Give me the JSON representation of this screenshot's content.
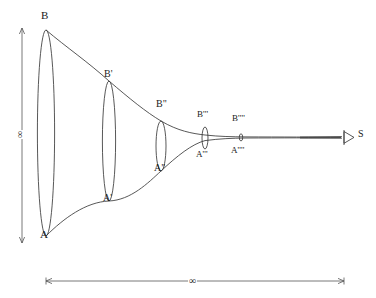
{
  "figure": {
    "type": "geometric-diagram",
    "background_color": "#ffffff",
    "stroke_color": "#3a3a3a",
    "text_color": "#1a1a1a",
    "axes": {
      "vertical": {
        "label": "∞",
        "label_rotated": true,
        "name": "vertical-extent-axis"
      },
      "horizontal": {
        "label": "∞",
        "name": "horizontal-extent-axis"
      }
    },
    "apex": {
      "label": "S",
      "name": "apex-point-s"
    },
    "cross_sections": [
      {
        "id": "section-0",
        "top_label": "B",
        "bottom_label": "A",
        "cx": 46,
        "cy": 133,
        "rx": 8.5,
        "ry": 103
      },
      {
        "id": "section-1",
        "top_label": "B'",
        "bottom_label": "A'",
        "cx": 109,
        "cy": 141,
        "rx": 6.5,
        "ry": 60
      },
      {
        "id": "section-2",
        "top_label": "B\"",
        "bottom_label": "A\"",
        "cx": 161,
        "cy": 143,
        "rx": 5,
        "ry": 28
      },
      {
        "id": "section-3",
        "top_label": "B'''",
        "bottom_label": "A'''",
        "cx": 205,
        "cy": 138,
        "rx": 3,
        "ry": 12
      },
      {
        "id": "section-4",
        "top_label": "B''''",
        "bottom_label": "A''''",
        "cx": 241,
        "cy": 137,
        "rx": 1.6,
        "ry": 4
      }
    ],
    "labels": [
      {
        "id": "lbl-B",
        "text": "B",
        "x": 41,
        "y": 11,
        "size": 11
      },
      {
        "id": "lbl-A",
        "text": "A",
        "x": 40,
        "y": 230,
        "size": 11
      },
      {
        "id": "lbl-Bp",
        "text": "B'",
        "x": 104,
        "y": 70,
        "size": 10
      },
      {
        "id": "lbl-Ap",
        "text": "A'",
        "x": 103,
        "y": 194,
        "size": 10
      },
      {
        "id": "lbl-Bpp",
        "text": "B\"",
        "x": 156,
        "y": 100,
        "size": 10
      },
      {
        "id": "lbl-App",
        "text": "A\"",
        "x": 154,
        "y": 164,
        "size": 10
      },
      {
        "id": "lbl-Bppp",
        "text": "B'''",
        "x": 197,
        "y": 111,
        "size": 9
      },
      {
        "id": "lbl-Appp",
        "text": "A'''",
        "x": 196,
        "y": 151,
        "size": 9
      },
      {
        "id": "lbl-Bpppp",
        "text": "B''''",
        "x": 232,
        "y": 115,
        "size": 9
      },
      {
        "id": "lbl-Apppp",
        "text": "A''''",
        "x": 231,
        "y": 147,
        "size": 9
      },
      {
        "id": "lbl-S",
        "text": "S",
        "x": 358,
        "y": 129,
        "size": 10
      }
    ],
    "infinity_symbol": "∞",
    "footer_trace": ""
  }
}
